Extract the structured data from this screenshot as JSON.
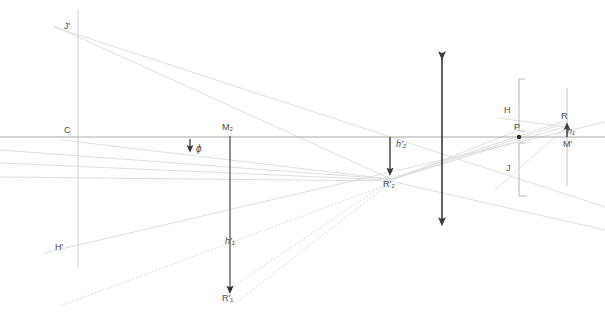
{
  "figure": {
    "type": "optical-ray-diagram",
    "background_color": "#ffffff",
    "width": 605,
    "height": 312,
    "colors": {
      "axis": "#9a9a9a",
      "ray_solid": "#d8d8d8",
      "ray_dotted": "#dcdcdc",
      "arrow_dark": "#3a3a3a",
      "label": "#4a4a4a",
      "bracket": "#b0b0b0",
      "vertical_thin": "#bdbdbd"
    }
  },
  "labels": {
    "j_prime": "J'",
    "c": "C",
    "h_prime_left": "H'",
    "m2": "M₂",
    "phi": "ϕ",
    "h2_prime": "h'₂",
    "r2_prime": "R'₂",
    "h1_prime": "h'₁",
    "r1_prime": "R'₁",
    "h_right": "H",
    "p": "P",
    "j_right": "J",
    "r_right": "R",
    "h1": "h₁",
    "m_prime": "M'"
  },
  "label_positions": {
    "j_prime": {
      "x": 64,
      "y": 22
    },
    "c": {
      "x": 64,
      "y": 126
    },
    "h_prime_left": {
      "x": 56,
      "y": 244
    },
    "m2": {
      "x": 222,
      "y": 124
    },
    "phi": {
      "x": 197,
      "y": 145
    },
    "h2_prime": {
      "x": 396,
      "y": 141
    },
    "r2_prime": {
      "x": 384,
      "y": 180
    },
    "h1_prime": {
      "x": 225,
      "y": 238
    },
    "r1_prime": {
      "x": 223,
      "y": 295
    },
    "h_right": {
      "x": 505,
      "y": 107
    },
    "p": {
      "x": 515,
      "y": 124
    },
    "j_right": {
      "x": 507,
      "y": 165
    },
    "r_right": {
      "x": 561,
      "y": 113
    },
    "h1": {
      "x": 566,
      "y": 127
    },
    "m_prime": {
      "x": 563,
      "y": 140
    }
  },
  "geometry": {
    "optical_axis": {
      "x1": 0,
      "y1": 137,
      "x2": 605,
      "y2": 137
    },
    "vertical_lines": [
      {
        "name": "axis-c-vertical",
        "x": 78,
        "y1": 10,
        "y2": 268
      },
      {
        "name": "axis-right-vertical",
        "x": 567,
        "y1": 88,
        "y2": 186
      }
    ],
    "brackets": [
      {
        "name": "bracket-upper",
        "x": 519,
        "y_top": 101,
        "y_bottom": 131,
        "tick": 6
      },
      {
        "name": "bracket-lower",
        "x": 519,
        "y_top": 143,
        "y_bottom": 184,
        "tick": 6
      }
    ],
    "arrows": [
      {
        "name": "arrow-h1-prime",
        "x1": 230,
        "y1": 136,
        "x2": 230,
        "y2": 293,
        "heads": "end"
      },
      {
        "name": "arrow-h2-prime",
        "x1": 390,
        "y1": 137,
        "x2": 390,
        "y2": 175,
        "heads": "end"
      },
      {
        "name": "arrow-phi",
        "x1": 190,
        "y1": 140,
        "x2": 190,
        "y2": 152,
        "heads": "end"
      },
      {
        "name": "arrow-double-center",
        "x1": 442,
        "y1": 52,
        "x2": 442,
        "y2": 226,
        "heads": "both"
      },
      {
        "name": "arrow-h1-right",
        "x1": 567,
        "y1": 138,
        "x2": 567,
        "y2": 122,
        "heads": "end"
      }
    ],
    "point_markers": [
      {
        "name": "point-p",
        "x": 519,
        "y": 137,
        "r": 2.2
      }
    ],
    "solid_rays": [
      {
        "name": "ray-jprime-to-r2",
        "x1": 54,
        "y1": 26,
        "x2": 393,
        "y2": 180
      },
      {
        "name": "ray-jprime-to-right-edge",
        "x1": 54,
        "y1": 27,
        "x2": 605,
        "y2": 206
      },
      {
        "name": "ray-c-axis-to-r2",
        "x1": 62,
        "y1": 140,
        "x2": 390,
        "y2": 179
      },
      {
        "name": "ray-hprime-to-right",
        "x1": 44,
        "y1": 253,
        "x2": 605,
        "y2": 123
      },
      {
        "name": "ray-r2-to-r",
        "x1": 390,
        "y1": 180,
        "x2": 567,
        "y2": 126
      },
      {
        "name": "ray-r2-to-h",
        "x1": 390,
        "y1": 180,
        "x2": 566,
        "y2": 124
      },
      {
        "name": "ray-left-edge-to-r2",
        "x1": 0,
        "y1": 163,
        "x2": 390,
        "y2": 180
      },
      {
        "name": "ray-left-edge-low-to-r2",
        "x1": 0,
        "y1": 176,
        "x2": 390,
        "y2": 181
      },
      {
        "name": "ray-r2-up-to-h-bracket",
        "x1": 390,
        "y1": 181,
        "x2": 519,
        "y2": 130
      },
      {
        "name": "ray-h-bracket-to-r",
        "x1": 510,
        "y1": 119,
        "x2": 567,
        "y2": 127
      },
      {
        "name": "ray-p-fan-upper",
        "x1": 390,
        "y1": 179,
        "x2": 564,
        "y2": 122
      },
      {
        "name": "ray-r-down-to-jbracket",
        "x1": 566,
        "y1": 127,
        "x2": 497,
        "y2": 186
      }
    ],
    "dotted_rays": [
      {
        "name": "dotted-r2-to-r1-a",
        "x1": 388,
        "y1": 182,
        "x2": 231,
        "y2": 288
      },
      {
        "name": "dotted-r2-to-r1-b",
        "x1": 390,
        "y1": 183,
        "x2": 236,
        "y2": 300
      },
      {
        "name": "dotted-r2-to-lower-left",
        "x1": 389,
        "y1": 184,
        "x2": 60,
        "y2": 305
      }
    ]
  }
}
